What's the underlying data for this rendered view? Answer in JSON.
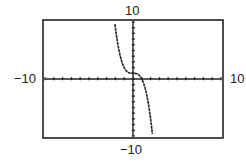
{
  "chart_data": {
    "type": "line",
    "title": "",
    "xlabel": "",
    "ylabel": "",
    "xlim": [
      -10,
      10
    ],
    "ylim": [
      -10,
      10
    ],
    "xscale": 1,
    "yscale": 1,
    "grid": false,
    "axis_tick_marks": true,
    "window_labels": {
      "xmin": "−10",
      "xmax": "10",
      "ymin": "−10",
      "ymax": "10"
    },
    "series": [
      {
        "name": "f(x)",
        "description": "decreasing cubic, approx y = 1 - x^3",
        "x": [
          -2.2,
          -2.0,
          -1.5,
          -1.0,
          -0.5,
          0.0,
          0.5,
          1.0,
          1.5,
          2.0,
          2.2
        ],
        "values": [
          10,
          9,
          4.4,
          2,
          1.1,
          1,
          0.9,
          0,
          -2.4,
          -7,
          -9.6
        ]
      }
    ]
  }
}
